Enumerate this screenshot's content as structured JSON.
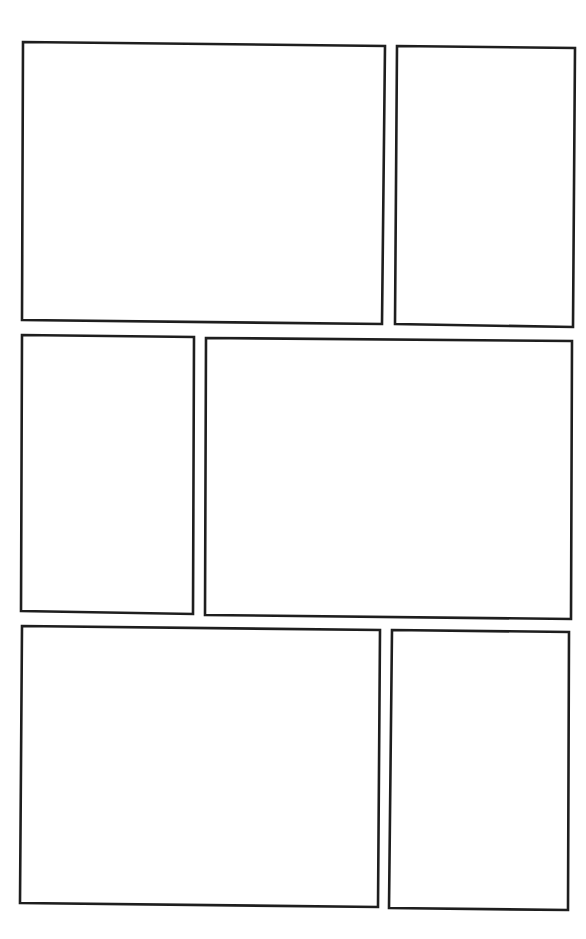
{
  "page": {
    "background": "#ffffff",
    "border_color": "#1e1e1e",
    "panel_count": 6
  },
  "panels": [
    {
      "id": 1,
      "row": 1,
      "points": "23,42 385,46 382,324 22,320"
    },
    {
      "id": 2,
      "row": 1,
      "points": "397,46 575,48 573,327 395,324"
    },
    {
      "id": 3,
      "row": 2,
      "points": "22,335 194,337 193,614 21,611"
    },
    {
      "id": 4,
      "row": 2,
      "points": "206,338 572,341 571,619 205,615"
    },
    {
      "id": 5,
      "row": 3,
      "points": "22,626 380,630 378,907 20,903"
    },
    {
      "id": 6,
      "row": 3,
      "points": "392,630 569,632 568,910 389,908"
    }
  ]
}
